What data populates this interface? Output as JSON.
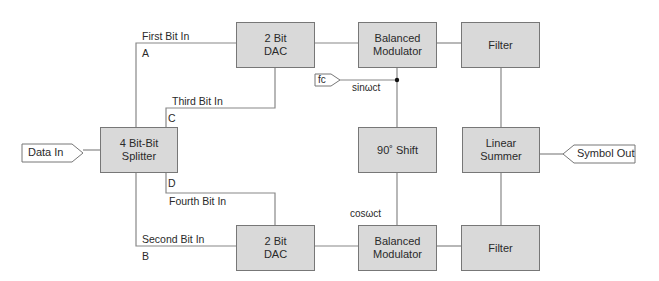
{
  "diagram": {
    "type": "block-diagram",
    "colors": {
      "block_fill": "#d9d9d9",
      "block_border": "#777777",
      "line": "#888888",
      "background": "#ffffff"
    },
    "blocks": {
      "splitter": "4 Bit-Bit\nSplitter",
      "dac_top": "2 Bit\nDAC",
      "dac_bottom": "2 Bit\nDAC",
      "mod_top": "Balanced\nModulator",
      "mod_bottom": "Balanced\nModulator",
      "shift": "90˚ Shift",
      "filter_top": "Filter",
      "filter_bottom": "Filter",
      "summer": "Linear\nSummer"
    },
    "ports": {
      "data_in": "Data In",
      "symbol_out": "Symbol Out",
      "carrier": "fc"
    },
    "signals": {
      "first_bit": "First Bit In",
      "second_bit": "Second Bit In",
      "third_bit": "Third Bit In",
      "fourth_bit": "Fourth Bit In",
      "a": "A",
      "b": "B",
      "c": "C",
      "d": "D",
      "sin": "sinωct",
      "cos": "cosωct"
    },
    "connections": [
      [
        "Data In",
        "4 Bit-Bit Splitter"
      ],
      [
        "Splitter A (First Bit In)",
        "Top 2 Bit DAC"
      ],
      [
        "Splitter C (Third Bit In)",
        "Top 2 Bit DAC"
      ],
      [
        "Splitter B (Second Bit In)",
        "Bottom 2 Bit DAC"
      ],
      [
        "Splitter D (Fourth Bit In)",
        "Bottom 2 Bit DAC"
      ],
      [
        "Top 2 Bit DAC",
        "Top Balanced Modulator"
      ],
      [
        "Bottom 2 Bit DAC",
        "Bottom Balanced Modulator"
      ],
      [
        "fc (sinωct)",
        "Top Balanced Modulator"
      ],
      [
        "fc (sinωct)",
        "90˚ Shift"
      ],
      [
        "90˚ Shift (cosωct)",
        "Bottom Balanced Modulator"
      ],
      [
        "Top Balanced Modulator",
        "Top Filter"
      ],
      [
        "Bottom Balanced Modulator",
        "Bottom Filter"
      ],
      [
        "Top Filter",
        "Linear Summer"
      ],
      [
        "Bottom Filter",
        "Linear Summer"
      ],
      [
        "Linear Summer",
        "Symbol Out"
      ]
    ]
  }
}
